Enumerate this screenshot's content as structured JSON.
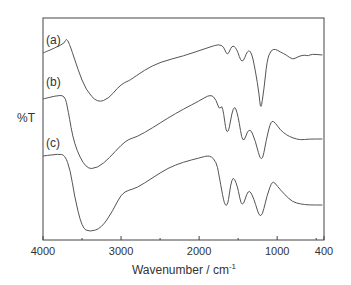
{
  "chart_data": {
    "type": "line",
    "title": "",
    "xlabel": "Wavenumber / cm-1",
    "xlabel_main": "Wavenumber / cm",
    "xlabel_sup": "-1",
    "ylabel": "%T",
    "xlim": [
      4000,
      400
    ],
    "x_reversed": true,
    "x_ticks": [
      4000,
      3000,
      2000,
      1000,
      400
    ],
    "x_minor_ticks": [
      3500,
      2500,
      1500,
      500
    ],
    "y_ticks": [],
    "grid": false,
    "legend": "inline labels at left of each trace",
    "series": [
      {
        "name": "(a)",
        "label_pos": [
          4000,
          40
        ],
        "points": [
          [
            4000,
            53
          ],
          [
            3850,
            48
          ],
          [
            3720,
            43
          ],
          [
            3700,
            38
          ],
          [
            3650,
            46
          ],
          [
            3550,
            70
          ],
          [
            3450,
            90
          ],
          [
            3300,
            103
          ],
          [
            3150,
            98
          ],
          [
            3050,
            88
          ],
          [
            2950,
            82
          ],
          [
            2900,
            81
          ],
          [
            2700,
            70
          ],
          [
            2500,
            62
          ],
          [
            2200,
            56
          ],
          [
            1900,
            48
          ],
          [
            1700,
            43
          ],
          [
            1640,
            57
          ],
          [
            1580,
            45
          ],
          [
            1520,
            48
          ],
          [
            1450,
            65
          ],
          [
            1380,
            50
          ],
          [
            1330,
            52
          ],
          [
            1280,
            70
          ],
          [
            1230,
            95
          ],
          [
            1210,
            111
          ],
          [
            1170,
            90
          ],
          [
            1130,
            60
          ],
          [
            1080,
            50
          ],
          [
            1020,
            49
          ],
          [
            960,
            52
          ],
          [
            880,
            55
          ],
          [
            800,
            60
          ],
          [
            720,
            56
          ],
          [
            640,
            55
          ],
          [
            600,
            56
          ],
          [
            560,
            54
          ],
          [
            420,
            55
          ]
        ]
      },
      {
        "name": "(b)",
        "label_pos": [
          4000,
          82
        ],
        "points": [
          [
            4000,
            99
          ],
          [
            3850,
            96
          ],
          [
            3720,
            95
          ],
          [
            3680,
            110
          ],
          [
            3600,
            145
          ],
          [
            3450,
            169
          ],
          [
            3300,
            168
          ],
          [
            3150,
            158
          ],
          [
            3000,
            145
          ],
          [
            2900,
            139
          ],
          [
            2800,
            137
          ],
          [
            2600,
            128
          ],
          [
            2400,
            118
          ],
          [
            2200,
            109
          ],
          [
            2000,
            101
          ],
          [
            1850,
            94
          ],
          [
            1780,
            100
          ],
          [
            1740,
            110
          ],
          [
            1700,
            104
          ],
          [
            1640,
            141
          ],
          [
            1560,
            103
          ],
          [
            1500,
            115
          ],
          [
            1440,
            146
          ],
          [
            1360,
            126
          ],
          [
            1280,
            140
          ],
          [
            1200,
            165
          ],
          [
            1140,
            140
          ],
          [
            1080,
            120
          ],
          [
            1020,
            123
          ],
          [
            960,
            130
          ],
          [
            880,
            135
          ],
          [
            800,
            138
          ],
          [
            700,
            140
          ],
          [
            600,
            139
          ],
          [
            420,
            139
          ]
        ]
      },
      {
        "name": "(c)",
        "label_pos": [
          4000,
          143
        ],
        "points": [
          [
            4000,
            156
          ],
          [
            3800,
            154
          ],
          [
            3720,
            155
          ],
          [
            3650,
            170
          ],
          [
            3600,
            195
          ],
          [
            3500,
            228
          ],
          [
            3400,
            232
          ],
          [
            3250,
            228
          ],
          [
            3100,
            210
          ],
          [
            3000,
            194
          ],
          [
            2900,
            190
          ],
          [
            2800,
            188
          ],
          [
            2600,
            178
          ],
          [
            2400,
            168
          ],
          [
            2200,
            162
          ],
          [
            2000,
            158
          ],
          [
            1860,
            155
          ],
          [
            1780,
            162
          ],
          [
            1750,
            173
          ],
          [
            1650,
            216
          ],
          [
            1580,
            174
          ],
          [
            1510,
            185
          ],
          [
            1450,
            210
          ],
          [
            1370,
            188
          ],
          [
            1300,
            198
          ],
          [
            1210,
            222
          ],
          [
            1130,
            195
          ],
          [
            1060,
            180
          ],
          [
            1000,
            186
          ],
          [
            900,
            195
          ],
          [
            800,
            202
          ],
          [
            700,
            204
          ],
          [
            600,
            205
          ],
          [
            420,
            205
          ]
        ]
      }
    ]
  },
  "layout": {
    "plot_left": 43,
    "plot_right": 324,
    "plot_top": 18,
    "plot_bottom": 240,
    "line_color": "#555555",
    "frame_color": "#444444"
  }
}
